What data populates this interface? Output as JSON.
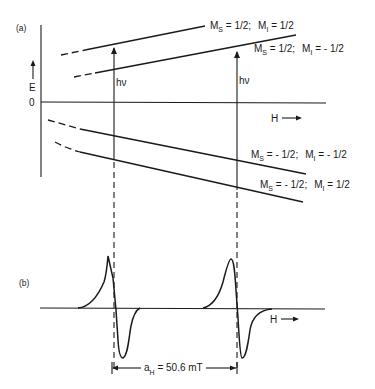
{
  "figure": {
    "panel_a": {
      "label": "(a)",
      "y_axis_label": "E",
      "zero_label": "0",
      "x_axis_label": "H",
      "levels": [
        {
          "ms": "1/2",
          "mi": "1/2",
          "ms_text": "M",
          "ms_sub": "S",
          "ms_val": " = 1/2;",
          "mi_text": "M",
          "mi_sub": "I",
          "mi_val": " = 1/2"
        },
        {
          "ms": "1/2",
          "mi": "-1/2",
          "ms_text": "M",
          "ms_sub": "S",
          "ms_val": " = 1/2;",
          "mi_text": "M",
          "mi_sub": "I",
          "mi_val": " = - 1/2"
        },
        {
          "ms": "-1/2",
          "mi": "-1/2",
          "ms_text": "M",
          "ms_sub": "S",
          "ms_val": " = - 1/2;",
          "mi_text": "M",
          "mi_sub": "I",
          "mi_val": " = - 1/2"
        },
        {
          "ms": "-1/2",
          "mi": "1/2",
          "ms_text": "M",
          "ms_sub": "S",
          "ms_val": " = - 1/2;",
          "mi_text": "M",
          "mi_sub": "I",
          "mi_val": " = 1/2"
        }
      ],
      "transitions": [
        {
          "label": "hν"
        },
        {
          "label": "hν"
        }
      ]
    },
    "panel_b": {
      "label": "(b)",
      "x_axis_label": "H",
      "splitting": {
        "symbol": "a",
        "sub": "H",
        "value_text": " = 50.6 mT"
      }
    },
    "colors": {
      "ink": "#1a1a1a",
      "background": "#ffffff"
    }
  }
}
